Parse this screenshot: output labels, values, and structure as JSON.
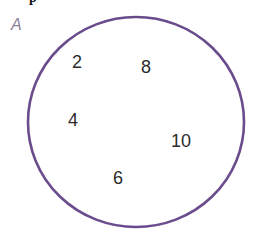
{
  "diagram": {
    "type": "venn",
    "top_fragment": "p",
    "set": {
      "label": "A",
      "label_color": "#8a7f96",
      "circle_color": "#6a4c8c",
      "elements": [
        {
          "value": "2",
          "x": 72,
          "y": 52
        },
        {
          "value": "8",
          "x": 141,
          "y": 57
        },
        {
          "value": "4",
          "x": 68,
          "y": 110
        },
        {
          "value": "10",
          "x": 171,
          "y": 131
        },
        {
          "value": "6",
          "x": 113,
          "y": 168
        }
      ]
    }
  }
}
